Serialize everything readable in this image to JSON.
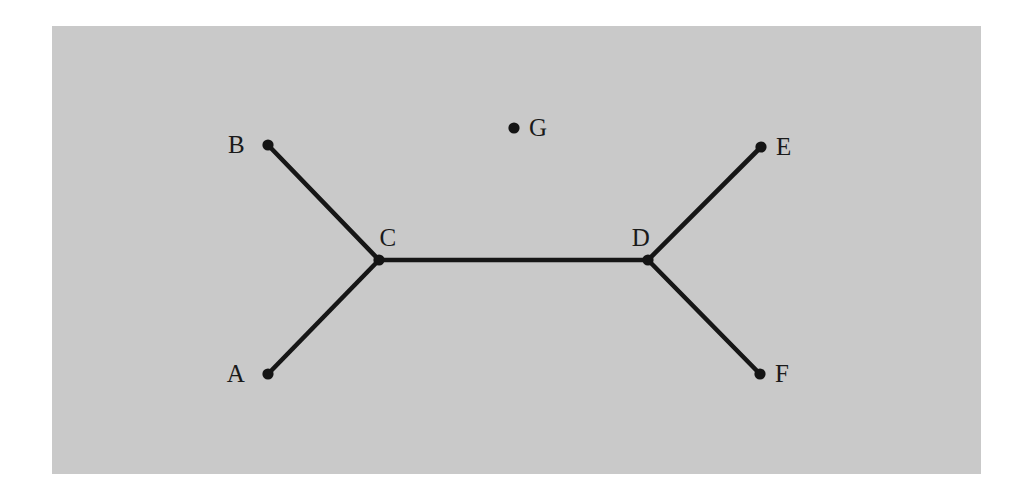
{
  "figure": {
    "kind": "undirected-graph-diagram",
    "width": 1029,
    "height": 498,
    "page_background": "#ffffff",
    "plate": {
      "name": "gray-plate",
      "x": 52,
      "y": 26,
      "width": 929,
      "height": 448,
      "color": "#c9c9c9"
    },
    "style": {
      "node_color": "#141414",
      "node_radius": 5.6,
      "edge_color": "#161616",
      "edge_width": 4.6,
      "label_color": "#1a1a1a",
      "label_font_size": 25
    }
  },
  "chart_data": {
    "type": "graph",
    "title": "",
    "xlabel": "",
    "ylabel": "",
    "grid": false,
    "legend": null,
    "directed": false,
    "node_count": 7,
    "edge_count": 5,
    "nodes": [
      {
        "id": "A",
        "label": "A",
        "x": 268,
        "y": 374,
        "label_x": 245,
        "label_y": 382,
        "label_anchor": "end",
        "degree": 1
      },
      {
        "id": "B",
        "label": "B",
        "x": 268,
        "y": 145,
        "label_x": 245,
        "label_y": 153,
        "label_anchor": "end",
        "degree": 1
      },
      {
        "id": "C",
        "label": "C",
        "x": 379,
        "y": 260,
        "label_x": 388,
        "label_y": 246,
        "label_anchor": "middle",
        "degree": 3
      },
      {
        "id": "D",
        "label": "D",
        "x": 648,
        "y": 260,
        "label_x": 641,
        "label_y": 246,
        "label_anchor": "middle",
        "degree": 3
      },
      {
        "id": "E",
        "label": "E",
        "x": 761,
        "y": 147,
        "label_x": 776,
        "label_y": 155,
        "label_anchor": "start",
        "degree": 1
      },
      {
        "id": "F",
        "label": "F",
        "x": 760,
        "y": 374,
        "label_x": 775,
        "label_y": 382,
        "label_anchor": "start",
        "degree": 1
      },
      {
        "id": "G",
        "label": "G",
        "x": 514,
        "y": 128,
        "label_x": 529,
        "label_y": 136,
        "label_anchor": "start",
        "degree": 0
      }
    ],
    "edges": [
      {
        "source": "B",
        "target": "C",
        "x1": 268,
        "y1": 145,
        "x2": 379,
        "y2": 260
      },
      {
        "source": "A",
        "target": "C",
        "x1": 268,
        "y1": 374,
        "x2": 379,
        "y2": 260
      },
      {
        "source": "C",
        "target": "D",
        "x1": 379,
        "y1": 260,
        "x2": 648,
        "y2": 260
      },
      {
        "source": "D",
        "target": "E",
        "x1": 648,
        "y1": 260,
        "x2": 761,
        "y2": 147
      },
      {
        "source": "D",
        "target": "F",
        "x1": 648,
        "y1": 260,
        "x2": 760,
        "y2": 374
      }
    ],
    "isolated_nodes": [
      "G"
    ],
    "annotations": []
  }
}
